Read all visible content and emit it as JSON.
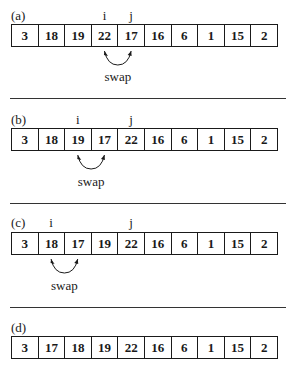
{
  "panels": [
    {
      "label": "(a)",
      "values": [
        "3",
        "18",
        "19",
        "22",
        "17",
        "16",
        "6",
        "1",
        "15",
        "2"
      ],
      "pointers": {
        "i": {
          "label": "i",
          "index": 3
        },
        "j": {
          "label": "j",
          "index": 4
        }
      },
      "swap": {
        "label": "swap",
        "from_index": 3,
        "to_index": 4
      }
    },
    {
      "label": "(b)",
      "values": [
        "3",
        "18",
        "19",
        "17",
        "22",
        "16",
        "6",
        "1",
        "15",
        "2"
      ],
      "pointers": {
        "i": {
          "label": "i",
          "index": 2
        },
        "j": {
          "label": "j",
          "index": 4
        }
      },
      "swap": {
        "label": "swap",
        "from_index": 2,
        "to_index": 3
      }
    },
    {
      "label": "(c)",
      "values": [
        "3",
        "18",
        "17",
        "19",
        "22",
        "16",
        "6",
        "1",
        "15",
        "2"
      ],
      "pointers": {
        "i": {
          "label": "i",
          "index": 1
        },
        "j": {
          "label": "j",
          "index": 4
        }
      },
      "swap": {
        "label": "swap",
        "from_index": 1,
        "to_index": 2
      }
    },
    {
      "label": "(d)",
      "values": [
        "3",
        "17",
        "18",
        "19",
        "22",
        "16",
        "6",
        "1",
        "15",
        "2"
      ],
      "pointers": null,
      "swap": null
    }
  ]
}
